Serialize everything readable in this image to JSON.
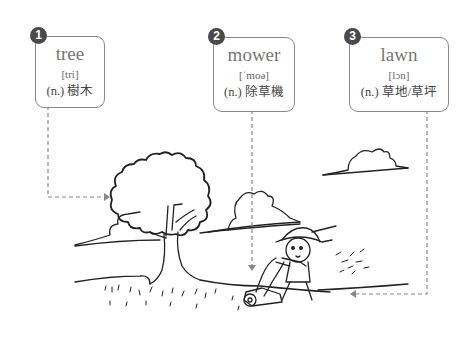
{
  "cards": [
    {
      "number": "1",
      "word": "tree",
      "ipa": "[tri]",
      "definition": "(n.) 樹木"
    },
    {
      "number": "2",
      "word": "mower",
      "ipa": "[ˈmoə]",
      "definition": "(n.) 除草機"
    },
    {
      "number": "3",
      "word": "lawn",
      "ipa": "[lɔn]",
      "definition": "(n.) 草地/草坪"
    }
  ],
  "colors": {
    "badge": "#4a4a4a",
    "card_border": "#8a8a8a",
    "dashed_line": "#888888",
    "ink": "#222222"
  },
  "illustration": {
    "scene": "boy pushing a lawn mower across a lawn next to a tree, with clouds"
  }
}
